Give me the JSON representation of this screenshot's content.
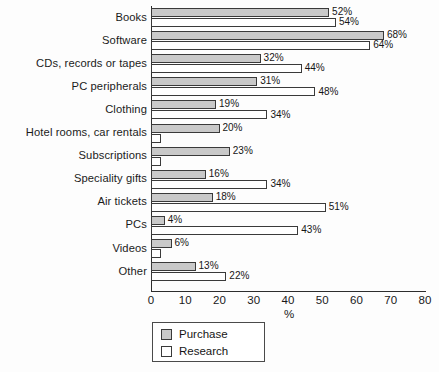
{
  "chart_data": {
    "type": "bar",
    "orientation": "horizontal",
    "title": "",
    "xlabel": "%",
    "ylabel": "",
    "xlim": [
      0,
      80
    ],
    "xticks": [
      0,
      10,
      20,
      30,
      40,
      50,
      60,
      70,
      80
    ],
    "grid": false,
    "legend_position": "bottom-left",
    "categories": [
      "Books",
      "Software",
      "CDs, records or tapes",
      "PC peripherals",
      "Clothing",
      "Hotel rooms, car rentals",
      "Subscriptions",
      "Speciality gifts",
      "Air tickets",
      "PCs",
      "Videos",
      "Other"
    ],
    "series": [
      {
        "name": "Purchase",
        "color": "#c9c9c9",
        "values": [
          52,
          68,
          32,
          31,
          19,
          20,
          23,
          16,
          18,
          4,
          6,
          13
        ],
        "labels": [
          "52%",
          "68%",
          "32%",
          "31%",
          "19%",
          "20%",
          "23%",
          "16%",
          "18%",
          "4%",
          "6%",
          "13%"
        ]
      },
      {
        "name": "Research",
        "color": "#ffffff",
        "values": [
          54,
          64,
          44,
          48,
          34,
          3,
          3,
          34,
          51,
          43,
          3,
          22
        ],
        "labels": [
          "54%",
          "64%",
          "44%",
          "48%",
          "34%",
          "",
          "",
          "34%",
          "51%",
          "43%",
          "",
          "22%"
        ]
      }
    ]
  },
  "legend": {
    "items": [
      {
        "label": "Purchase",
        "swatch": "purchase"
      },
      {
        "label": "Research",
        "swatch": "research"
      }
    ]
  }
}
